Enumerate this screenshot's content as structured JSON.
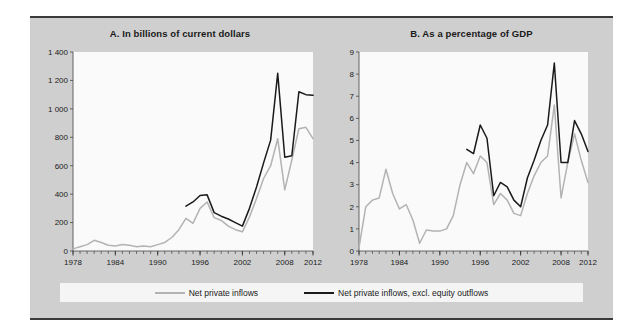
{
  "figure": {
    "background": "#cfcfcf",
    "plot_background": "#fafafa",
    "rule_color": "#3a3a3a"
  },
  "legend": {
    "series": [
      {
        "label": "Net private inflows",
        "color": "#b3b3b3"
      },
      {
        "label": "Net private inflows, excl. equity outflows",
        "color": "#1a1a1a"
      }
    ]
  },
  "chart_data": [
    {
      "type": "line",
      "panel": "A",
      "title": "A. In billions of current dollars",
      "xlabel": "",
      "ylabel": "",
      "xlim": [
        1978,
        2012
      ],
      "ylim": [
        0,
        1400
      ],
      "ytick_values": [
        0,
        200,
        400,
        600,
        800,
        1000,
        1200,
        1400
      ],
      "ytick_labels": [
        "0",
        "200",
        "400",
        "600",
        "800",
        "1 000",
        "1 200",
        "1 400"
      ],
      "xtick_values": [
        1978,
        1984,
        1990,
        1996,
        2002,
        2008,
        2012
      ],
      "xtick_labels": [
        "1978",
        "1984",
        "1990",
        "1996",
        "2002",
        "2008",
        "2012"
      ],
      "grid": false,
      "legend_position": "below-figure",
      "x": [
        1978,
        1979,
        1980,
        1981,
        1982,
        1983,
        1984,
        1985,
        1986,
        1987,
        1988,
        1989,
        1990,
        1991,
        1992,
        1993,
        1994,
        1995,
        1996,
        1997,
        1998,
        1999,
        2000,
        2001,
        2002,
        2003,
        2004,
        2005,
        2006,
        2007,
        2008,
        2009,
        2010,
        2011,
        2012
      ],
      "series": [
        {
          "name": "Net private inflows",
          "color": "#b3b3b3",
          "values": [
            15,
            30,
            45,
            75,
            60,
            40,
            35,
            45,
            40,
            30,
            35,
            30,
            45,
            60,
            95,
            150,
            230,
            195,
            300,
            345,
            235,
            215,
            175,
            150,
            135,
            240,
            370,
            510,
            600,
            790,
            430,
            640,
            860,
            870,
            790
          ]
        },
        {
          "name": "Net private inflows, excl. equity outflows",
          "color": "#1a1a1a",
          "values": [
            null,
            null,
            null,
            null,
            null,
            null,
            null,
            null,
            null,
            null,
            null,
            null,
            null,
            null,
            null,
            null,
            315,
            345,
            390,
            395,
            270,
            245,
            225,
            200,
            175,
            300,
            450,
            620,
            780,
            1250,
            660,
            670,
            1120,
            1100,
            1095
          ]
        }
      ]
    },
    {
      "type": "line",
      "panel": "B",
      "title": "B. As a percentage of GDP",
      "xlabel": "",
      "ylabel": "",
      "xlim": [
        1978,
        2012
      ],
      "ylim": [
        0,
        9
      ],
      "ytick_values": [
        0,
        1,
        2,
        3,
        4,
        5,
        6,
        7,
        8,
        9
      ],
      "ytick_labels": [
        "0",
        "1",
        "2",
        "3",
        "4",
        "5",
        "6",
        "7",
        "8",
        "9"
      ],
      "xtick_values": [
        1978,
        1984,
        1990,
        1996,
        2002,
        2008,
        2012
      ],
      "xtick_labels": [
        "1978",
        "1984",
        "1990",
        "1996",
        "2002",
        "2008",
        "2012"
      ],
      "grid": false,
      "legend_position": "below-figure",
      "x": [
        1978,
        1979,
        1980,
        1981,
        1982,
        1983,
        1984,
        1985,
        1986,
        1987,
        1988,
        1989,
        1990,
        1991,
        1992,
        1993,
        1994,
        1995,
        1996,
        1997,
        1998,
        1999,
        2000,
        2001,
        2002,
        2003,
        2004,
        2005,
        2006,
        2007,
        2008,
        2009,
        2010,
        2011,
        2012
      ],
      "series": [
        {
          "name": "Net private inflows",
          "color": "#b3b3b3",
          "values": [
            0.15,
            2.0,
            2.3,
            2.4,
            3.7,
            2.6,
            1.9,
            2.1,
            1.4,
            0.35,
            0.95,
            0.9,
            0.9,
            1.0,
            1.6,
            3.0,
            4.0,
            3.5,
            4.3,
            4.0,
            2.1,
            2.6,
            2.3,
            1.7,
            1.6,
            2.6,
            3.4,
            4.0,
            4.3,
            6.6,
            2.4,
            4.0,
            5.3,
            4.1,
            3.1
          ]
        },
        {
          "name": "Net private inflows, excl. equity outflows",
          "color": "#1a1a1a",
          "values": [
            null,
            null,
            null,
            null,
            null,
            null,
            null,
            null,
            null,
            null,
            null,
            null,
            null,
            null,
            null,
            null,
            4.6,
            4.4,
            5.7,
            5.1,
            2.5,
            3.1,
            2.9,
            2.3,
            2.0,
            3.3,
            4.1,
            5.0,
            5.7,
            8.5,
            4.0,
            4.0,
            5.9,
            5.3,
            4.5
          ]
        }
      ]
    }
  ]
}
